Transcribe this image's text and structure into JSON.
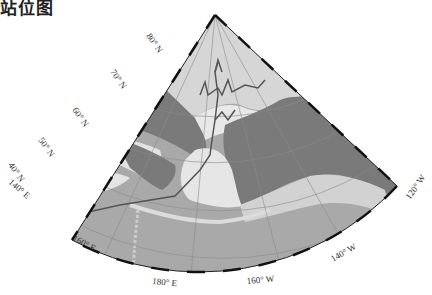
{
  "title": "站位图",
  "map": {
    "projection": "polar-sector",
    "colors": {
      "land": "#7a7a7a",
      "shelf": "#e6e6e6",
      "shallow": "#cfcfcf",
      "deep_ocean": "#a8a8a8",
      "arctic_basin": "#dcdcdc",
      "track": "#5a5a5a",
      "frame": "#111111",
      "grid": "#8c8c8c"
    },
    "lat_labels": [
      "80° N",
      "70° N",
      "60° N",
      "50° N",
      "40° N"
    ],
    "lon_labels": [
      "140° E",
      "160° E",
      "180° E",
      "160° W",
      "140° W",
      "120° W"
    ]
  }
}
